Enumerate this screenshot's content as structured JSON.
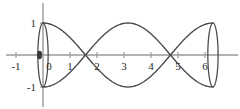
{
  "figure": {
    "name": "cosine-surface-of-revolution-sketch",
    "background": "#ffffff",
    "curve_color": "#4a4a4a",
    "axis_color": "#9a9a9a",
    "label_color": "#2b2b2b",
    "origin_marker_color": "#3a3a3a"
  },
  "axis": {
    "x_label_0": "0",
    "x_labels": [
      "-1",
      "1",
      "2",
      "3",
      "4",
      "5",
      "6"
    ],
    "y_label_top": "1",
    "y_label_bottom": "-1"
  },
  "chart_data": {
    "type": "line",
    "title": "",
    "xlabel": "",
    "ylabel": "",
    "xlim": [
      -1.6,
      7.1
    ],
    "ylim": [
      -1.7,
      1.7
    ],
    "grid": false,
    "legend": "none",
    "xticks": [
      -1,
      0,
      1,
      2,
      3,
      4,
      5,
      6
    ],
    "xticklabels": [
      "-1",
      "0",
      "1",
      "2",
      "3",
      "4",
      "5",
      "6"
    ],
    "yticks": [
      -1,
      1
    ],
    "yticklabels": [
      "-1",
      "1"
    ],
    "annotations": [
      {
        "text": "0",
        "x": 0.18,
        "y": -0.3,
        "role": "origin-label"
      },
      {
        "text": "1",
        "x": -0.3,
        "y": 1.0,
        "role": "y-tick-label"
      },
      {
        "text": "-1",
        "x": -0.45,
        "y": -1.0,
        "role": "y-tick-label"
      },
      {
        "text": "filled-dot",
        "x": -0.12,
        "y": 0.0,
        "role": "origin-marker"
      }
    ],
    "series": [
      {
        "name": "cos(x)",
        "expression": "y = cos(x)",
        "domain": [
          0,
          6.2832
        ],
        "x": [
          0,
          0.3927,
          0.7854,
          1.1781,
          1.5708,
          1.9635,
          2.3562,
          2.7489,
          3.1416,
          3.5343,
          3.927,
          4.3197,
          4.7124,
          5.1051,
          5.4978,
          5.8905,
          6.2832
        ],
        "values": [
          1.0,
          0.9239,
          0.7071,
          0.3827,
          0.0,
          -0.3827,
          -0.7071,
          -0.9239,
          -1.0,
          -0.9239,
          -0.7071,
          -0.3827,
          0.0,
          0.3827,
          0.7071,
          0.9239,
          1.0
        ]
      },
      {
        "name": "-cos(x)",
        "expression": "y = -cos(x)",
        "domain": [
          0,
          6.2832
        ],
        "x": [
          0,
          0.3927,
          0.7854,
          1.1781,
          1.5708,
          1.9635,
          2.3562,
          2.7489,
          3.1416,
          3.5343,
          3.927,
          4.3197,
          4.7124,
          5.1051,
          5.4978,
          5.8905,
          6.2832
        ],
        "values": [
          -1.0,
          -0.9239,
          -0.7071,
          -0.3827,
          0.0,
          0.3827,
          0.7071,
          0.9239,
          1.0,
          0.9239,
          0.7071,
          0.3827,
          0.0,
          -0.3827,
          -0.7071,
          -0.9239,
          -1.0
        ]
      }
    ],
    "ellipses": [
      {
        "name": "end-cap-left",
        "center_x": 0.0,
        "center_y": 0.0,
        "semi_axis_x": 0.19,
        "semi_axis_y": 1.0
      },
      {
        "name": "end-cap-right",
        "center_x": 6.2832,
        "center_y": 0.0,
        "semi_axis_x": 0.19,
        "semi_axis_y": 1.0
      }
    ],
    "crossings": [
      1.5708,
      4.7124
    ]
  }
}
